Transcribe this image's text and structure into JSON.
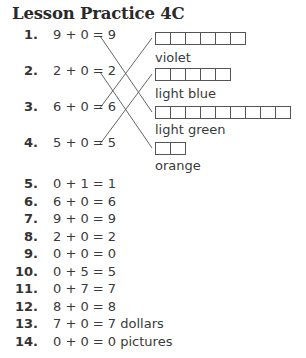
{
  "title": "Lesson Practice 4C",
  "matching": {
    "items": [
      {
        "number": "1.",
        "equation": "9 + 0 = 9",
        "answer": 9
      },
      {
        "number": "2.",
        "equation": "2 + 0 = 2",
        "answer": 2
      },
      {
        "number": "3.",
        "equation": "6 + 0 = 6",
        "answer": 6
      },
      {
        "number": "4.",
        "equation": "5 + 0 = 5",
        "answer": 5
      }
    ],
    "targets": [
      {
        "boxes": 6,
        "label": "violet"
      },
      {
        "boxes": 5,
        "label": "light blue"
      },
      {
        "boxes": 9,
        "label": "light green"
      },
      {
        "boxes": 2,
        "label": "orange"
      }
    ],
    "connections": [
      {
        "from_item": 1,
        "to_target": 3
      },
      {
        "from_item": 2,
        "to_target": 4
      },
      {
        "from_item": 3,
        "to_target": 1
      },
      {
        "from_item": 4,
        "to_target": 2
      }
    ]
  },
  "problems": [
    {
      "number": "5.",
      "equation": "0 + 1 = 1"
    },
    {
      "number": "6.",
      "equation": "6 + 0 = 6"
    },
    {
      "number": "7.",
      "equation": "9 + 0 = 9"
    },
    {
      "number": "8.",
      "equation": "2 + 0 = 2"
    },
    {
      "number": "9.",
      "equation": "0 + 0 = 0"
    },
    {
      "number": "10.",
      "equation": "0 + 5 = 5"
    },
    {
      "number": "11.",
      "equation": "0 + 7 = 7"
    },
    {
      "number": "12.",
      "equation": "8 + 0 = 8"
    },
    {
      "number": "13.",
      "equation": "7 + 0 = 7 dollars"
    },
    {
      "number": "14.",
      "equation": "0 + 0 = 0 pictures"
    }
  ]
}
